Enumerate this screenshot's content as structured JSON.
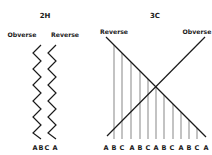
{
  "panels": [
    {
      "id": "2H",
      "title": "2H",
      "left_label": "Obverse",
      "right_label": "Reverse",
      "bottom_labels": [
        "A",
        "B",
        "C",
        "A"
      ],
      "description": "Two parallel zigzag lines running vertically"
    },
    {
      "id": "3C",
      "title": "3C",
      "left_label": "Reverse",
      "right_label": "Obverse",
      "bottom_labels": [
        "A",
        "B",
        "C",
        "A",
        "B",
        "C",
        "A",
        "B",
        "C",
        "A",
        "B",
        "C",
        "A"
      ],
      "description": "Two crossing diagonal lines with vertical hatch lines dropping from the Reverse diagonal"
    }
  ],
  "colors": {
    "ink": "#1a1a1a",
    "hatch": "#555555",
    "background": "#ffffff"
  }
}
